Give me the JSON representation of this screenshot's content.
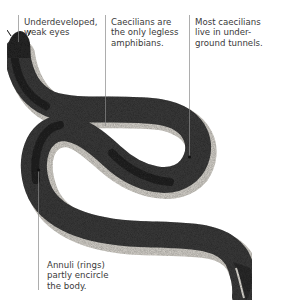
{
  "figure": {
    "subject": "Caecilian",
    "annotations": [
      {
        "id": "eyes",
        "lines": [
          "Underdeveloped,",
          "weak eyes"
        ]
      },
      {
        "id": "legless",
        "lines": [
          "Caecilians are",
          "the only legless",
          "amphibians."
        ]
      },
      {
        "id": "tunnels",
        "lines": [
          "Most caecilians",
          "live in under-",
          "ground tunnels."
        ]
      },
      {
        "id": "annuli",
        "lines": [
          "Annuli (rings)",
          "partly encircle",
          "the body."
        ]
      }
    ],
    "colors": {
      "body": "#3c3c3c",
      "body_dark": "#232323",
      "belly": "#d9d6cf",
      "leader": "#8a8a8a",
      "text": "#3a3a3a"
    }
  }
}
